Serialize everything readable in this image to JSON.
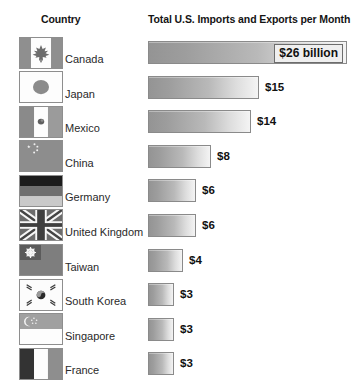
{
  "headers": {
    "country": "Country",
    "bars": "Total U.S. Imports and Exports per Month"
  },
  "colors": {
    "bar_start": "#949494",
    "bar_end": "#f4f4f4",
    "bar_border": "#8a8a8a",
    "text": "#1b1b1b",
    "background": "#ffffff"
  },
  "chart_data": {
    "type": "bar",
    "orientation": "horizontal",
    "title": "Total U.S. Imports and Exports per Month",
    "xlabel": "",
    "ylabel": "Country",
    "unit": "billion USD per month",
    "grid": false,
    "legend": false,
    "xlim": [
      0,
      26
    ],
    "categories": [
      "Canada",
      "Japan",
      "Mexico",
      "China",
      "Germany",
      "United Kingdom",
      "Taiwan",
      "South Korea",
      "Singapore",
      "France"
    ],
    "values": [
      26,
      15,
      14,
      8,
      6,
      6,
      4,
      3,
      3,
      3
    ],
    "value_labels": [
      "$26 billion",
      "$15",
      "$14",
      "$8",
      "$6",
      "$6",
      "$4",
      "$3",
      "$3",
      "$3"
    ],
    "label_placement": [
      "inside",
      "outside",
      "outside",
      "outside",
      "outside",
      "outside",
      "outside",
      "outside",
      "outside",
      "outside"
    ]
  },
  "rows": [
    {
      "country": "Canada",
      "value": 26,
      "label": "$26 billion",
      "bar_width": 199,
      "flag": "canada-flag",
      "placement": "inside"
    },
    {
      "country": "Japan",
      "value": 15,
      "label": "$15",
      "bar_width": 111,
      "flag": "japan-flag",
      "placement": "outside"
    },
    {
      "country": "Mexico",
      "value": 14,
      "label": "$14",
      "bar_width": 103,
      "flag": "mexico-flag",
      "placement": "outside"
    },
    {
      "country": "China",
      "value": 8,
      "label": "$8",
      "bar_width": 63,
      "flag": "china-flag",
      "placement": "outside"
    },
    {
      "country": "Germany",
      "value": 6,
      "label": "$6",
      "bar_width": 48,
      "flag": "germany-flag",
      "placement": "outside"
    },
    {
      "country": "United Kingdom",
      "value": 6,
      "label": "$6",
      "bar_width": 48,
      "flag": "united-kingdom-flag",
      "placement": "outside"
    },
    {
      "country": "Taiwan",
      "value": 4,
      "label": "$4",
      "bar_width": 35,
      "flag": "taiwan-flag",
      "placement": "outside"
    },
    {
      "country": "South Korea",
      "value": 3,
      "label": "$3",
      "bar_width": 26,
      "flag": "south-korea-flag",
      "placement": "outside"
    },
    {
      "country": "Singapore",
      "value": 3,
      "label": "$3",
      "bar_width": 26,
      "flag": "singapore-flag",
      "placement": "outside"
    },
    {
      "country": "France",
      "value": 3,
      "label": "$3",
      "bar_width": 26,
      "flag": "france-flag",
      "placement": "outside"
    }
  ]
}
